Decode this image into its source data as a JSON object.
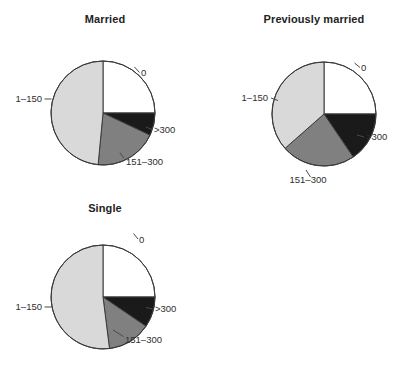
{
  "figure": {
    "colors": {
      "zero": "#ffffff",
      "low": "#d9d9d9",
      "mid": "#808080",
      "high": "#1a1a1a",
      "outline": "#3a3a3a",
      "text": "#2e2e2e"
    },
    "category_order": [
      "0",
      "1–150",
      "151–300",
      ">300"
    ]
  },
  "chart_data": [
    {
      "type": "pie",
      "title": "Married",
      "labels": [
        "0",
        ">300",
        "151–300",
        "1–150"
      ],
      "values": [
        25,
        7,
        19.5,
        48.5
      ],
      "colors": [
        "#ffffff",
        "#1a1a1a",
        "#808080",
        "#d9d9d9"
      ],
      "start_angle_deg": 0,
      "direction": "clockwise",
      "xlabel": "",
      "ylabel": "",
      "grid": false,
      "legend": "none",
      "annotations": [
        "0",
        ">300",
        "151–300",
        "1–150"
      ]
    },
    {
      "type": "pie",
      "title": "Previously married",
      "labels": [
        "0",
        ">300",
        "151–300",
        "1–150"
      ],
      "values": [
        25,
        15.5,
        23,
        36.5
      ],
      "colors": [
        "#ffffff",
        "#1a1a1a",
        "#808080",
        "#d9d9d9"
      ],
      "start_angle_deg": 0,
      "direction": "clockwise",
      "xlabel": "",
      "ylabel": "",
      "grid": false,
      "legend": "none",
      "annotations": [
        "0",
        ">300",
        "151–300",
        "1–150"
      ]
    },
    {
      "type": "pie",
      "title": "Single",
      "labels": [
        "0",
        ">300",
        "151–300",
        "1–150"
      ],
      "values": [
        25,
        9.5,
        13.5,
        52
      ],
      "colors": [
        "#ffffff",
        "#1a1a1a",
        "#808080",
        "#d9d9d9"
      ],
      "start_angle_deg": 0,
      "direction": "clockwise",
      "xlabel": "",
      "ylabel": "",
      "grid": false,
      "legend": "none",
      "annotations": [
        "0",
        ">300",
        "151–300",
        "1–150"
      ]
    }
  ],
  "panels": {
    "married": {
      "title": "Married",
      "labels": {
        "zero": "0",
        "low": "1–150",
        "mid": "151–300",
        "high": ">300"
      }
    },
    "previously_married": {
      "title": "Previously married",
      "labels": {
        "zero": "0",
        "low": "1–150",
        "mid": "151–300",
        "high": ">300"
      }
    },
    "single": {
      "title": "Single",
      "labels": {
        "zero": "0",
        "low": "1–150",
        "mid": "151–300",
        "high": ">300"
      }
    }
  }
}
